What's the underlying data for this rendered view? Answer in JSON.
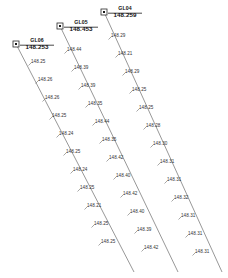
{
  "drawing": {
    "title": "Ground level section lines",
    "background_color": "#ffffff",
    "line_color": "#6b6b6b",
    "text_color": "#333333",
    "marker_color": "#1a1a1a"
  },
  "stations": [
    {
      "name": "GL06",
      "elevation": "148.253",
      "marker_icon": "square-node-icon",
      "label_x": 18,
      "label_y": 38,
      "marker_x": 13,
      "marker_y": 41,
      "line": {
        "x1": 16,
        "y1": 44,
        "x2": 134,
        "y2": 272
      }
    },
    {
      "name": "GL05",
      "elevation": "148.453",
      "marker_icon": "square-node-icon",
      "label_x": 62,
      "label_y": 20,
      "marker_x": 57,
      "marker_y": 23,
      "line": {
        "x1": 60,
        "y1": 26,
        "x2": 178,
        "y2": 272
      }
    },
    {
      "name": "GL04",
      "elevation": "148.259",
      "marker_icon": "square-node-icon",
      "label_x": 106,
      "label_y": 6,
      "marker_x": 101,
      "marker_y": 9,
      "line": {
        "x1": 104,
        "y1": 12,
        "x2": 222,
        "y2": 272
      }
    }
  ],
  "spot_levels": {
    "GL06": [
      {
        "value": "148.25",
        "x": 31,
        "y": 60
      },
      {
        "value": "148.26",
        "x": 38,
        "y": 78
      },
      {
        "value": "148.26",
        "x": 45,
        "y": 96
      },
      {
        "value": "148.25",
        "x": 52,
        "y": 114
      },
      {
        "value": "148.24",
        "x": 59,
        "y": 132
      },
      {
        "value": "148.25",
        "x": 66,
        "y": 150
      },
      {
        "value": "148.24",
        "x": 73,
        "y": 168
      },
      {
        "value": "148.25",
        "x": 80,
        "y": 186
      },
      {
        "value": "148.21",
        "x": 87,
        "y": 204
      },
      {
        "value": "148.25",
        "x": 94,
        "y": 222
      },
      {
        "value": "148.25",
        "x": 101,
        "y": 240
      }
    ],
    "GL05": [
      {
        "value": "148.44",
        "x": 67,
        "y": 48
      },
      {
        "value": "148.39",
        "x": 74,
        "y": 66
      },
      {
        "value": "148.39",
        "x": 81,
        "y": 84
      },
      {
        "value": "148.35",
        "x": 88,
        "y": 102
      },
      {
        "value": "148.44",
        "x": 95,
        "y": 120
      },
      {
        "value": "148.35",
        "x": 102,
        "y": 138
      },
      {
        "value": "148.42",
        "x": 109,
        "y": 156
      },
      {
        "value": "148.40",
        "x": 116,
        "y": 174
      },
      {
        "value": "148.42",
        "x": 123,
        "y": 192
      },
      {
        "value": "148.40",
        "x": 130,
        "y": 210
      },
      {
        "value": "148.39",
        "x": 137,
        "y": 228
      },
      {
        "value": "148.42",
        "x": 144,
        "y": 246
      }
    ],
    "GL04": [
      {
        "value": "148.29",
        "x": 111,
        "y": 34
      },
      {
        "value": "148.21",
        "x": 118,
        "y": 52
      },
      {
        "value": "148.29",
        "x": 125,
        "y": 70
      },
      {
        "value": "148.25",
        "x": 132,
        "y": 88
      },
      {
        "value": "148.25",
        "x": 139,
        "y": 106
      },
      {
        "value": "148.28",
        "x": 146,
        "y": 124
      },
      {
        "value": "148.30",
        "x": 153,
        "y": 142
      },
      {
        "value": "148.31",
        "x": 160,
        "y": 160
      },
      {
        "value": "148.31",
        "x": 167,
        "y": 178
      },
      {
        "value": "148.32",
        "x": 174,
        "y": 196
      },
      {
        "value": "148.31",
        "x": 181,
        "y": 214
      },
      {
        "value": "148.31",
        "x": 188,
        "y": 232
      },
      {
        "value": "148.31",
        "x": 195,
        "y": 250
      }
    ]
  }
}
